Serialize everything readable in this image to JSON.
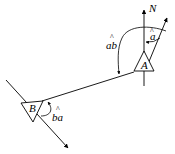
{
  "diagram": {
    "type": "bearing-diagram",
    "labels": {
      "north": "N",
      "station_a": "A",
      "station_b": "B",
      "angle_a": "a",
      "angle_ab": "ab",
      "angle_ba": "ba",
      "hat": "^"
    },
    "colors": {
      "stroke": "#000000",
      "background": "#ffffff"
    }
  }
}
